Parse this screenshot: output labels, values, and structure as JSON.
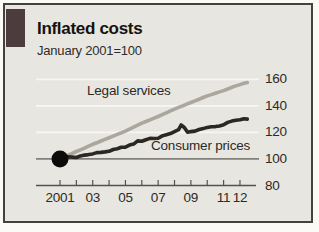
{
  "header": {
    "title": "Inflated costs",
    "subtitle": "January 2001=100"
  },
  "colors": {
    "tab": "#4d3c3d",
    "chart_background": "#e8e6e1",
    "frame_border": "#45423e",
    "legal_services_line": "#aba79c",
    "consumer_prices_line": "#2a2825",
    "start_dot": "#0c0b0a",
    "gridline_white": "#f7f6f2",
    "baseline_100": "#82807b",
    "axis": "#55524d",
    "text": "#2c2a26"
  },
  "chart_data": {
    "type": "line",
    "title": "Inflated costs",
    "subtitle": "January 2001=100",
    "legend_position": "inline-labels",
    "grid": "on",
    "x_axis": {
      "range": [
        2000.6,
        2012.9
      ],
      "tick_years": [
        2001,
        2002,
        2003,
        2004,
        2005,
        2006,
        2007,
        2008,
        2009,
        2010,
        2011,
        2012
      ],
      "tick_labels": [
        "2001",
        "03",
        "05",
        "07",
        "09",
        "11",
        "12"
      ],
      "tick_label_years": [
        2001,
        2003,
        2005,
        2007,
        2009,
        2011,
        2012
      ]
    },
    "y_axis": {
      "range": [
        80,
        165
      ],
      "ticks": [
        160,
        140,
        120,
        100,
        80
      ],
      "tick_labels": [
        "160",
        "140",
        "120",
        "100",
        "80"
      ],
      "baseline_value": 100
    },
    "start_marker": {
      "year": 2001.0,
      "value": 100,
      "shape": "filled-circle"
    },
    "series": [
      {
        "name": "Legal services",
        "color": "#aba79c",
        "x": [
          2001.0,
          2001.25,
          2001.5,
          2001.75,
          2002.0,
          2002.25,
          2002.5,
          2002.75,
          2003.0,
          2003.25,
          2003.5,
          2003.75,
          2004.0,
          2004.25,
          2004.5,
          2004.75,
          2005.0,
          2005.25,
          2005.5,
          2005.75,
          2006.0,
          2006.25,
          2006.5,
          2006.75,
          2007.0,
          2007.25,
          2007.5,
          2007.75,
          2008.0,
          2008.25,
          2008.5,
          2008.75,
          2009.0,
          2009.25,
          2009.5,
          2009.75,
          2010.0,
          2010.25,
          2010.5,
          2010.75,
          2011.0,
          2011.25,
          2011.5,
          2011.75,
          2012.0,
          2012.25,
          2012.45
        ],
        "values": [
          100.0,
          101.3,
          102.8,
          104.2,
          105.6,
          106.9,
          108.2,
          109.6,
          111.0,
          112.2,
          113.5,
          114.8,
          116.0,
          117.2,
          118.5,
          119.7,
          121.0,
          122.5,
          124.0,
          125.5,
          127.0,
          128.2,
          129.5,
          130.8,
          132.0,
          133.4,
          134.8,
          136.2,
          137.5,
          138.8,
          140.0,
          141.3,
          142.5,
          143.8,
          145.0,
          146.3,
          147.5,
          148.5,
          149.5,
          150.5,
          151.5,
          152.7,
          154.0,
          155.0,
          156.0,
          157.0,
          157.5
        ]
      },
      {
        "name": "Consumer prices",
        "color": "#2a2825",
        "x": [
          2001.0,
          2001.25,
          2001.5,
          2001.75,
          2002.0,
          2002.25,
          2002.5,
          2002.75,
          2003.0,
          2003.25,
          2003.5,
          2003.75,
          2004.0,
          2004.25,
          2004.5,
          2004.75,
          2005.0,
          2005.25,
          2005.5,
          2005.75,
          2006.0,
          2006.25,
          2006.5,
          2006.75,
          2007.0,
          2007.25,
          2007.5,
          2007.75,
          2008.0,
          2008.25,
          2008.4,
          2008.6,
          2008.8,
          2009.0,
          2009.25,
          2009.5,
          2009.75,
          2010.0,
          2010.25,
          2010.5,
          2010.75,
          2011.0,
          2011.25,
          2011.5,
          2011.75,
          2012.0,
          2012.25,
          2012.45
        ],
        "values": [
          100.0,
          101.0,
          101.7,
          101.4,
          101.1,
          102.3,
          102.9,
          103.3,
          103.8,
          104.8,
          104.9,
          105.3,
          105.8,
          107.1,
          107.7,
          108.8,
          108.9,
          110.4,
          111.2,
          113.6,
          113.3,
          114.5,
          115.5,
          115.4,
          115.6,
          117.4,
          118.3,
          119.1,
          120.6,
          122.0,
          125.6,
          123.7,
          120.1,
          120.6,
          121.0,
          122.2,
          122.9,
          123.8,
          124.3,
          124.4,
          124.9,
          125.7,
          127.5,
          128.5,
          129.1,
          129.5,
          130.3,
          130.0
        ]
      }
    ]
  }
}
